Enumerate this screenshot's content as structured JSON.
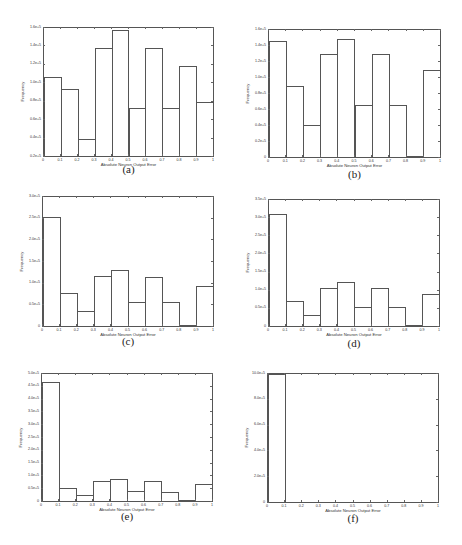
{
  "chart_data": [
    {
      "id": "a",
      "type": "bar",
      "caption": "(a)",
      "xlabel": "Absolute Neuron Output Error",
      "ylabel": "Frequency",
      "x_ticks": [
        "0",
        "0.1",
        "0.2",
        "0.3",
        "0.4",
        "0.5",
        "0.6",
        "0.7",
        "0.8",
        "0.9",
        "1"
      ],
      "y_ticks": [
        "0.2e+5",
        "0.4e+5",
        "0.6e+5",
        "0.8e+5",
        "1.0e+5",
        "1.2e+5",
        "1.4e+5",
        "1.6e+5"
      ],
      "ylim": [
        20000,
        160000
      ],
      "bins": [
        [
          0,
          0.1
        ],
        [
          0.1,
          0.2
        ],
        [
          0.2,
          0.3
        ],
        [
          0.3,
          0.4
        ],
        [
          0.4,
          0.5
        ],
        [
          0.5,
          0.6
        ],
        [
          0.6,
          0.7
        ],
        [
          0.7,
          0.8
        ],
        [
          0.8,
          0.9
        ],
        [
          0.9,
          1.0
        ]
      ],
      "values": [
        106000,
        93000,
        39000,
        138000,
        158000,
        72000,
        138000,
        72000,
        118000,
        79000
      ]
    },
    {
      "id": "b",
      "type": "bar",
      "caption": "(b)",
      "xlabel": "Absolute Neuron Output Error",
      "ylabel": "Frequency",
      "x_ticks": [
        "0",
        "0.1",
        "0.2",
        "0.3",
        "0.4",
        "0.5",
        "0.6",
        "0.7",
        "0.8",
        "0.9",
        "1"
      ],
      "y_ticks": [
        "0",
        "0.2e+5",
        "0.4e+5",
        "0.6e+5",
        "0.8e+5",
        "1.0e+5",
        "1.2e+5",
        "1.4e+5",
        "1.6e+5"
      ],
      "ylim": [
        0,
        160000
      ],
      "bins": [
        [
          0,
          0.1
        ],
        [
          0.1,
          0.2
        ],
        [
          0.2,
          0.3
        ],
        [
          0.3,
          0.4
        ],
        [
          0.4,
          0.5
        ],
        [
          0.5,
          0.6
        ],
        [
          0.6,
          0.7
        ],
        [
          0.7,
          0.8
        ],
        [
          0.8,
          0.9
        ],
        [
          0.9,
          1.0
        ]
      ],
      "values": [
        146000,
        89000,
        40000,
        130000,
        149000,
        65000,
        130000,
        65000,
        1000,
        110000
      ]
    },
    {
      "id": "c",
      "type": "bar",
      "caption": "(c)",
      "xlabel": "Absolute Neuron Output Error",
      "ylabel": "Frequency",
      "x_ticks": [
        "0",
        "0.1",
        "0.2",
        "0.3",
        "0.4",
        "0.5",
        "0.6",
        "0.7",
        "0.8",
        "0.9",
        "1"
      ],
      "y_ticks": [
        "0",
        "0.5e+5",
        "1.0e+5",
        "1.5e+5",
        "2.0e+5",
        "2.5e+5",
        "3.0e+5"
      ],
      "ylim": [
        0,
        300000
      ],
      "bins": [
        [
          0,
          0.1
        ],
        [
          0.1,
          0.2
        ],
        [
          0.2,
          0.3
        ],
        [
          0.3,
          0.4
        ],
        [
          0.4,
          0.5
        ],
        [
          0.5,
          0.6
        ],
        [
          0.6,
          0.7
        ],
        [
          0.7,
          0.8
        ],
        [
          0.8,
          0.9
        ],
        [
          0.9,
          1.0
        ]
      ],
      "values": [
        254000,
        76000,
        35000,
        116000,
        130000,
        57000,
        114000,
        56000,
        1000,
        94000
      ]
    },
    {
      "id": "d",
      "type": "bar",
      "caption": "(d)",
      "xlabel": "Absolute Neuron Output Error",
      "ylabel": "Frequency",
      "x_ticks": [
        "0",
        "0.1",
        "0.2",
        "0.3",
        "0.4",
        "0.5",
        "0.6",
        "0.7",
        "0.8",
        "0.9",
        "1"
      ],
      "y_ticks": [
        "0",
        "0.5e+5",
        "1.0e+5",
        "1.5e+5",
        "2.0e+5",
        "2.5e+5",
        "3.0e+5",
        "3.5e+5"
      ],
      "ylim": [
        0,
        350000
      ],
      "bins": [
        [
          0,
          0.1
        ],
        [
          0.1,
          0.2
        ],
        [
          0.2,
          0.3
        ],
        [
          0.3,
          0.4
        ],
        [
          0.4,
          0.5
        ],
        [
          0.5,
          0.6
        ],
        [
          0.6,
          0.7
        ],
        [
          0.7,
          0.8
        ],
        [
          0.8,
          0.9
        ],
        [
          0.9,
          1.0
        ]
      ],
      "values": [
        310000,
        70000,
        31000,
        106000,
        122000,
        53000,
        105000,
        52000,
        1000,
        88000
      ]
    },
    {
      "id": "e",
      "type": "bar",
      "caption": "(e)",
      "xlabel": "Absolute Neuron Output Error",
      "ylabel": "Frequency",
      "x_ticks": [
        "0",
        "0.1",
        "0.2",
        "0.3",
        "0.4",
        "0.5",
        "0.6",
        "0.7",
        "0.8",
        "0.9",
        "1"
      ],
      "y_ticks": [
        "0",
        "0.5e+5",
        "1.0e+5",
        "1.5e+5",
        "2.0e+5",
        "2.5e+5",
        "3.0e+5",
        "3.5e+5",
        "4.0e+5",
        "4.5e+5",
        "5.0e+5"
      ],
      "ylim": [
        0,
        500000
      ],
      "bins": [
        [
          0,
          0.1
        ],
        [
          0.1,
          0.2
        ],
        [
          0.2,
          0.3
        ],
        [
          0.3,
          0.4
        ],
        [
          0.4,
          0.5
        ],
        [
          0.5,
          0.6
        ],
        [
          0.6,
          0.7
        ],
        [
          0.7,
          0.8
        ],
        [
          0.8,
          0.9
        ],
        [
          0.9,
          1.0
        ]
      ],
      "values": [
        470000,
        51000,
        24000,
        80000,
        88000,
        40000,
        78000,
        36000,
        1000,
        66000
      ]
    },
    {
      "id": "f",
      "type": "bar",
      "caption": "(f)",
      "xlabel": "Absolute Neuron Output Error",
      "ylabel": "Frequency",
      "x_ticks": [
        "0",
        "0.1",
        "0.2",
        "0.3",
        "0.4",
        "0.5",
        "0.6",
        "0.7",
        "0.8",
        "0.9",
        "1"
      ],
      "y_ticks": [
        "0",
        "2.0e+5",
        "4.0e+5",
        "6.0e+5",
        "8.0e+5",
        "10.0e+5"
      ],
      "ylim": [
        0,
        1000000
      ],
      "bins": [
        [
          0,
          0.1
        ],
        [
          0.1,
          0.2
        ],
        [
          0.2,
          0.3
        ],
        [
          0.3,
          0.4
        ],
        [
          0.4,
          0.5
        ],
        [
          0.5,
          0.6
        ],
        [
          0.6,
          0.7
        ],
        [
          0.7,
          0.8
        ],
        [
          0.8,
          0.9
        ],
        [
          0.9,
          1.0
        ]
      ],
      "values": [
        1000000,
        0,
        0,
        0,
        0,
        0,
        0,
        0,
        0,
        0
      ]
    }
  ]
}
